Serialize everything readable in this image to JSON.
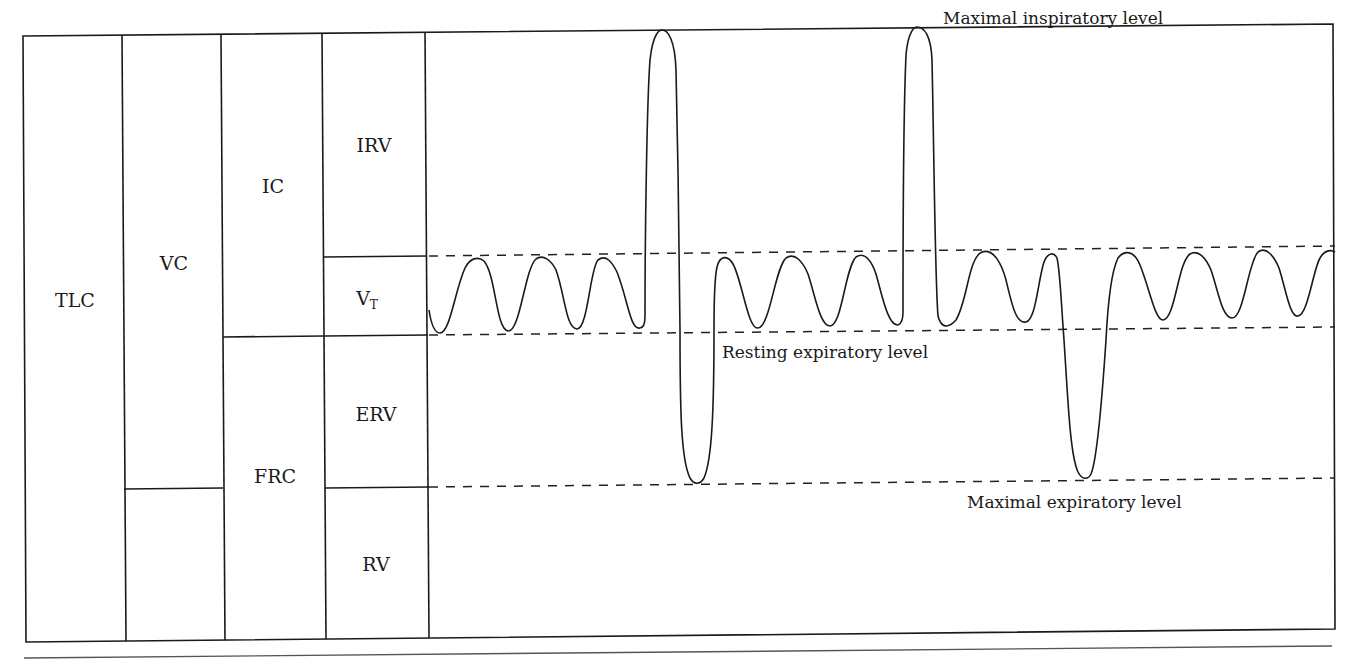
{
  "diagram": {
    "type": "spirogram-lung-volumes",
    "columns": [
      {
        "id": "tlc",
        "cells": [
          {
            "label": "TLC"
          }
        ]
      },
      {
        "id": "vc",
        "cells": [
          {
            "label": "VC"
          },
          {
            "label": ""
          }
        ]
      },
      {
        "id": "capacities",
        "cells": [
          {
            "label": "IC"
          },
          {
            "label": "FRC"
          }
        ]
      },
      {
        "id": "volumes",
        "cells": [
          {
            "label": "IRV"
          },
          {
            "label": "V",
            "subscript": "T"
          },
          {
            "label": "ERV"
          },
          {
            "label": "RV"
          }
        ]
      }
    ],
    "annotations": {
      "max_inspiratory": "Maximal inspiratory level",
      "resting_expiratory": "Resting expiratory level",
      "max_expiratory": "Maximal expiratory level"
    },
    "trace": {
      "description": "Spirometer trace: tidal breaths, then a maximal inspiration followed by a maximal expiration, tidal breaths, another maximal inspiration, tidal breaths, a maximal expiration, then tidal breaths",
      "sequence": [
        "tidal",
        "tidal",
        "tidal",
        "max-inspiration",
        "max-expiration",
        "tidal",
        "tidal",
        "tidal",
        "max-inspiration",
        "tidal",
        "tidal",
        "max-expiration",
        "tidal",
        "tidal",
        "tidal",
        "tidal"
      ]
    }
  }
}
